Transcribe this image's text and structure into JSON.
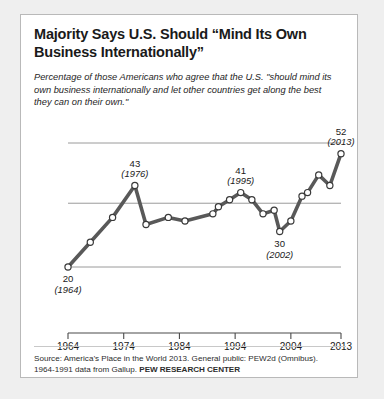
{
  "card": {
    "title": "Majority Says U.S. Should “Mind Its Own Business Internationally”",
    "title_line1": "Majority Says U.S. Should “Mind Its Own",
    "title_line2": "Business Internationally”",
    "subtitle": "Percentage of those Americans who agree that the U.S. \"should mind its own business internationally and let other countries get along the best they can on their own.\"",
    "source_line1": "Source: America’s Place in the World 2013. General public: PEW2d (Omnibus).",
    "source_line2_prefix": "1964-1991 data from Gallup. ",
    "source_brand": "PEW RESEARCH CENTER"
  },
  "colors": {
    "background": "#efefef",
    "card_background": "#ffffff",
    "card_border": "#b9b9b9",
    "line": "#595959",
    "marker_fill": "#ffffff",
    "marker_stroke": "#3a3a3a",
    "gridline": "#9a9a9a",
    "axis": "#4a4a4a",
    "text": "#1a1a1a"
  },
  "chart_data": {
    "type": "line",
    "title": "Majority Says U.S. Should “Mind Its Own Business Internationally”",
    "xlabel": "",
    "ylabel": "",
    "xlim": [
      1964,
      2013
    ],
    "ylim": [
      14,
      58
    ],
    "grid": true,
    "gridlines": [
      20,
      38,
      55
    ],
    "legend": "none",
    "xticks": [
      "1964",
      "1974",
      "1984",
      "1994",
      "2004",
      "2013"
    ],
    "xtick_values": [
      1964,
      1974,
      1984,
      1994,
      2004,
      2013
    ],
    "x": [
      1964,
      1968,
      1972,
      1976,
      1978,
      1982,
      1985,
      1990,
      1991,
      1993,
      1995,
      1997,
      1999,
      2001,
      2002,
      2004,
      2006,
      2007,
      2009,
      2011,
      2013
    ],
    "values": [
      20,
      27,
      34,
      43,
      32,
      34,
      33,
      35,
      37,
      39,
      41,
      39,
      35,
      36,
      30,
      33,
      40,
      41,
      46,
      43,
      52
    ],
    "annotations": [
      {
        "label": "20",
        "year_label": "(1964)",
        "x": 1964,
        "y": 20,
        "position": "below"
      },
      {
        "label": "43",
        "year_label": "(1976)",
        "x": 1976,
        "y": 43,
        "position": "above"
      },
      {
        "label": "41",
        "year_label": "(1995)",
        "x": 1995,
        "y": 41,
        "position": "above"
      },
      {
        "label": "30",
        "year_label": "(2002)",
        "x": 2002,
        "y": 30,
        "position": "below"
      },
      {
        "label": "52",
        "year_label": "(2013)",
        "x": 2013,
        "y": 52,
        "position": "above"
      }
    ]
  }
}
